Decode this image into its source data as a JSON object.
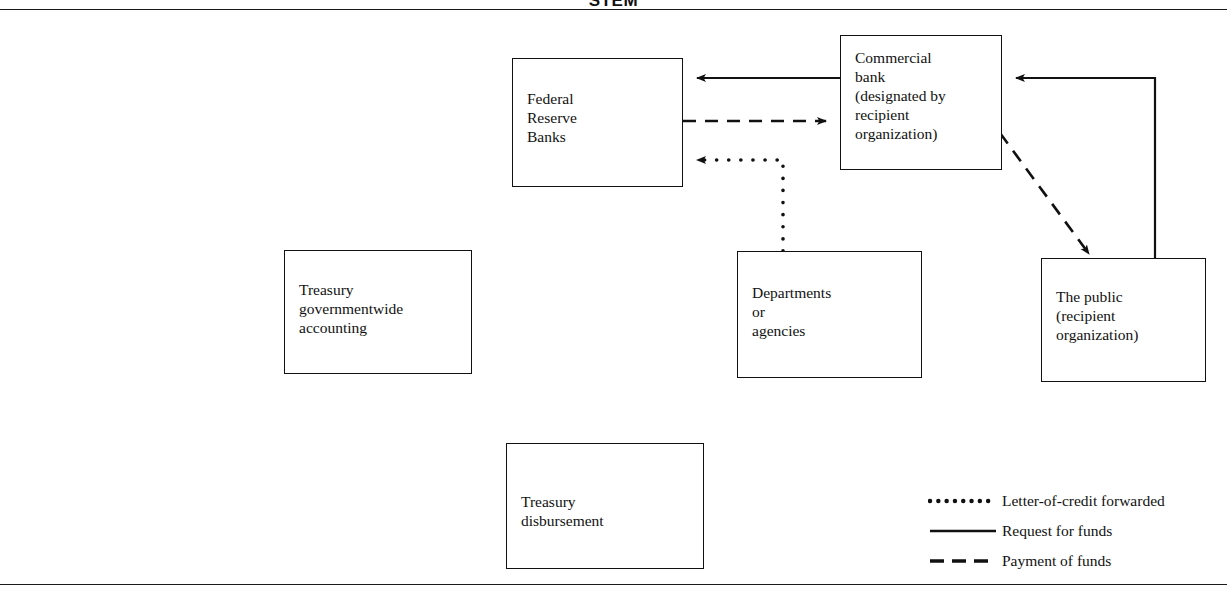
{
  "title": "STEM",
  "figure": {
    "title_full": "FEDERAL RESERVE BANK SYSTEM"
  },
  "nodes": [
    {
      "id": "federal-reserve-banks",
      "label": "Federal\nReserve\nBanks"
    },
    {
      "id": "commercial-bank",
      "label": "Commercial\nbank\n(designated by\nrecipient\norganization)"
    },
    {
      "id": "treasury-governmentwide-accounting",
      "label": "Treasury\ngovernmentwide\naccounting"
    },
    {
      "id": "departments-or-agencies",
      "label": "Departments\nor\nagencies"
    },
    {
      "id": "the-public",
      "label": "The public\n(recipient\norganization)"
    },
    {
      "id": "treasury-disbursement",
      "label": "Treasury\ndisbursement"
    }
  ],
  "edges": [
    {
      "id": "commercial-to-frb-request",
      "style": "solid",
      "from": "commercial-bank",
      "to": "federal-reserve-banks"
    },
    {
      "id": "frb-to-commercial-payment",
      "style": "dashed",
      "from": "federal-reserve-banks",
      "to": "commercial-bank"
    },
    {
      "id": "departments-to-frb-loc",
      "style": "dotted",
      "from": "departments-or-agencies",
      "to": "federal-reserve-banks"
    },
    {
      "id": "public-to-commercial-request",
      "style": "solid",
      "from": "the-public",
      "to": "commercial-bank"
    },
    {
      "id": "commercial-to-public-payment",
      "style": "dashed",
      "from": "commercial-bank",
      "to": "the-public"
    }
  ],
  "legend": {
    "items": [
      {
        "style": "dotted",
        "label": "Letter-of-credit forwarded"
      },
      {
        "style": "solid",
        "label": "Request for funds"
      },
      {
        "style": "dashed",
        "label": "Payment of funds"
      }
    ]
  },
  "colors": {
    "line": "#111111",
    "background": "#ffffff"
  }
}
